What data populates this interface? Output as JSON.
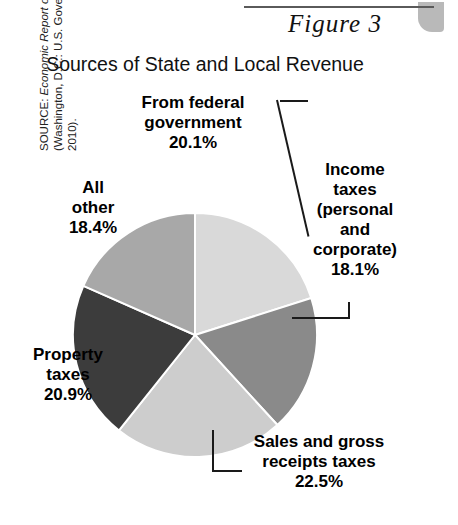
{
  "figure": {
    "number_label": "Figure 3",
    "title": "Sources of State and Local Revenue"
  },
  "source": {
    "prefix": "SOURCE: ",
    "italic_part": "Economic Report of the President, 2010",
    "rest": " (Washington, D.C.: U.S. Government Printing Office; 2010)."
  },
  "labels": {
    "federal": {
      "name": "From federal\ngovernment",
      "line1": "From federal",
      "line2": "government",
      "pct": "20.1%"
    },
    "income": {
      "line1": "Income",
      "line2": "taxes",
      "line3": "(personal",
      "line4": "and",
      "line5": "corporate)",
      "pct": "18.1%"
    },
    "allother": {
      "line1": "All",
      "line2": "other",
      "pct": "18.4%"
    },
    "property": {
      "line1": "Property",
      "line2": "taxes",
      "pct": "20.9%"
    },
    "sales": {
      "line1": "Sales and gross",
      "line2": "receipts taxes",
      "pct": "22.5%"
    }
  },
  "colors": {
    "federal": "#d9d9d9",
    "income": "#8a8a8a",
    "sales": "#cdcdcd",
    "property": "#3c3c3c",
    "allother": "#a8a8a8",
    "outline": "#ffffff",
    "rule": "#5a5a5a",
    "text": "#000000"
  },
  "chart_data": {
    "type": "pie",
    "title": "Sources of State and Local Revenue",
    "figure_label": "Figure 3",
    "categories": [
      "From federal government",
      "Income taxes (personal and corporate)",
      "Sales and gross receipts taxes",
      "Property taxes",
      "All other"
    ],
    "values": [
      20.1,
      18.1,
      22.5,
      20.9,
      18.4
    ],
    "units": "percent",
    "start_angle_deg": 0,
    "direction": "clockwise",
    "slice_colors": [
      "#d9d9d9",
      "#8a8a8a",
      "#cdcdcd",
      "#3c3c3c",
      "#a8a8a8"
    ],
    "labels_shown": [
      "20.1%",
      "18.1%",
      "22.5%",
      "20.9%",
      "18.4%"
    ],
    "legend": "none (direct labels with leader lines)",
    "grid": false,
    "source": "SOURCE: Economic Report of the President, 2010 (Washington, D.C.: U.S. Government Printing Office; 2010)."
  }
}
